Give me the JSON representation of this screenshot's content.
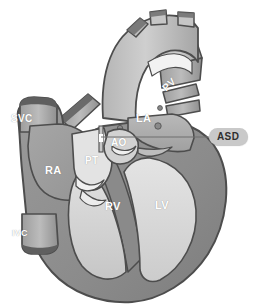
{
  "figure": {
    "background_color": "#ffffff",
    "style": "grayscale medical illustration"
  },
  "colors": {
    "outline": "#4d4d4d",
    "myocardium": "#8e8e8e",
    "myocardium_dark": "#767676",
    "vessel_light": "#c4c4c4",
    "vessel_mid": "#a8a8a8",
    "chamber_light": "#dcdcdc",
    "chamber_mid": "#9b9b9b",
    "chamber_pale": "#ededed",
    "cut_end_dark": "#6a6a6a",
    "label_text": "#ffffff",
    "callout_fill": "#c9c9c9",
    "callout_text": "#2f2f2f",
    "leader_line": "#6f6f6f"
  },
  "anatomy_labels": [
    {
      "id": "svc",
      "text": "SVC",
      "meaning": "superior vena cava"
    },
    {
      "id": "ivc",
      "text": "IVC",
      "meaning": "inferior vena cava"
    },
    {
      "id": "ra",
      "text": "RA",
      "meaning": "right atrium"
    },
    {
      "id": "pt",
      "text": "PT",
      "meaning": "pulmonary trunk"
    },
    {
      "id": "ao",
      "text": "AO",
      "meaning": "aorta"
    },
    {
      "id": "la",
      "text": "LA",
      "meaning": "left atrium"
    },
    {
      "id": "pv",
      "text": "PV",
      "meaning": "pulmonary veins"
    },
    {
      "id": "rv",
      "text": "RV",
      "meaning": "right ventricle"
    },
    {
      "id": "lv",
      "text": "LV",
      "meaning": "left ventricle"
    }
  ],
  "callout": {
    "label": "ASD",
    "meaning": "atrial septal defect",
    "leader_line": true
  }
}
